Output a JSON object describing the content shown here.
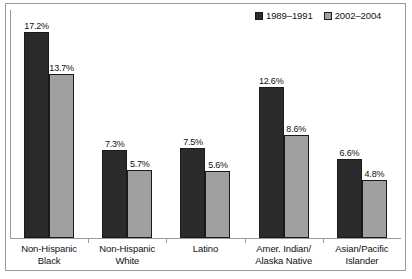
{
  "chart_data": {
    "type": "bar",
    "title": "",
    "subtitle": "",
    "xlabel": "",
    "ylabel": "",
    "grid": false,
    "legend_position": "top-right",
    "ylim": [
      0,
      19
    ],
    "categories": [
      "Non-Hispanic Black",
      "Non-Hispanic White",
      "Latino",
      "Amer. Indian/ Alaska Native",
      "Asian/Pacific Islander"
    ],
    "category_lines": [
      [
        "Non-Hispanic",
        "Black"
      ],
      [
        "Non-Hispanic",
        "White"
      ],
      [
        "Latino",
        ""
      ],
      [
        "Amer. Indian/",
        "Alaska Native"
      ],
      [
        "Asian/Pacific",
        "Islander"
      ]
    ],
    "series": [
      {
        "name": "1989–1991",
        "color": "#2b2b2b",
        "values": [
          17.2,
          7.3,
          7.5,
          12.6,
          6.6
        ],
        "labels": [
          "17.2%",
          "7.3%",
          "7.5%",
          "12.6%",
          "6.6%"
        ]
      },
      {
        "name": "2002–2004",
        "color": "#a0a0a0",
        "values": [
          13.7,
          5.7,
          5.6,
          8.6,
          4.8
        ],
        "labels": [
          "13.7%",
          "5.7%",
          "5.6%",
          "8.6%",
          "4.8%"
        ]
      }
    ]
  },
  "legend": {
    "entries": [
      {
        "label": "1989–1991",
        "color": "#2b2b2b"
      },
      {
        "label": "2002–2004",
        "color": "#a0a0a0"
      }
    ]
  },
  "colors": {
    "series_1989_1991": "#2b2b2b",
    "series_2002_2004": "#a0a0a0",
    "frame": "#9a9a9a",
    "text": "#101010",
    "background": "#ffffff"
  },
  "bottom_caption": ""
}
